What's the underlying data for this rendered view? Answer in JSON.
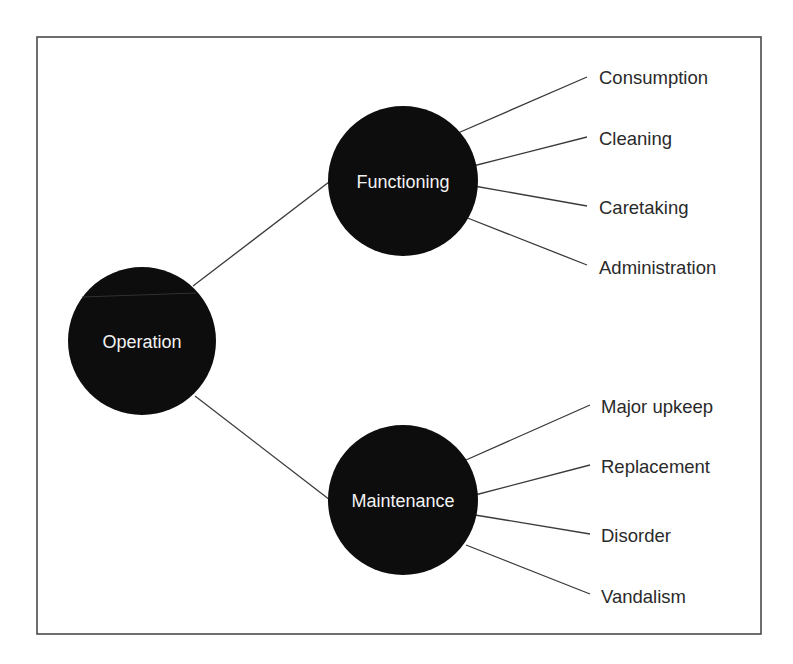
{
  "diagram": {
    "type": "tree",
    "frame": {
      "x": 37,
      "y": 37,
      "width": 724,
      "height": 597
    },
    "colors": {
      "node_fill": "#0d0d0d",
      "node_text": "#f2f2f2",
      "leaf_text": "#2a2a2a",
      "edge": "#3a3a3a",
      "frame": "#4a4a4a",
      "background": "#ffffff"
    },
    "root": {
      "id": "operation",
      "label": "Operation",
      "cx": 142,
      "cy": 341,
      "r": 74
    },
    "branches": [
      {
        "id": "functioning",
        "label": "Functioning",
        "cx": 403,
        "cy": 181,
        "r": 75,
        "edge_from_root": {
          "x1": 193,
          "y1": 286,
          "x2": 329,
          "y2": 182
        },
        "leaves": [
          {
            "label": "Consumption",
            "x1": 458,
            "y1": 133,
            "x2": 587,
            "y2": 77,
            "tx": 599,
            "ty": 84
          },
          {
            "label": "Cleaning",
            "x1": 473,
            "y1": 166,
            "x2": 587,
            "y2": 137,
            "tx": 599,
            "ty": 145
          },
          {
            "label": "Caretaking",
            "x1": 474,
            "y1": 186,
            "x2": 587,
            "y2": 206,
            "tx": 599,
            "ty": 214
          },
          {
            "label": "Administration",
            "x1": 465,
            "y1": 217,
            "x2": 587,
            "y2": 265,
            "tx": 599,
            "ty": 274
          }
        ]
      },
      {
        "id": "maintenance",
        "label": "Maintenance",
        "cx": 403,
        "cy": 500,
        "r": 75,
        "edge_from_root": {
          "x1": 195,
          "y1": 396,
          "x2": 330,
          "y2": 500
        },
        "leaves": [
          {
            "label": "Major upkeep",
            "x1": 466,
            "y1": 460,
            "x2": 590,
            "y2": 405,
            "tx": 601,
            "ty": 413
          },
          {
            "label": "Replacement",
            "x1": 475,
            "y1": 495,
            "x2": 590,
            "y2": 465,
            "tx": 601,
            "ty": 473
          },
          {
            "label": "Disorder",
            "x1": 475,
            "y1": 515,
            "x2": 590,
            "y2": 534,
            "tx": 601,
            "ty": 542
          },
          {
            "label": "Vandalism",
            "x1": 466,
            "y1": 545,
            "x2": 590,
            "y2": 594,
            "tx": 601,
            "ty": 603
          }
        ]
      }
    ]
  }
}
